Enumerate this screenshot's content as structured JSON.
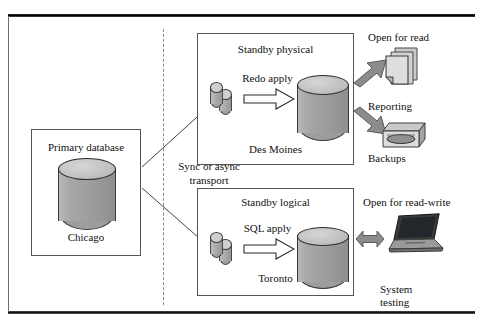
{
  "figure": {
    "divider": "dashed-vertical-separator"
  },
  "primary": {
    "title": "Primary database",
    "city": "Chicago",
    "icon": "database-cylinder-icon"
  },
  "transport": {
    "label": "Sync or async transport",
    "line1": "Sync or async",
    "line2": "transport"
  },
  "physical_standby": {
    "title": "Standby physical",
    "city": "Des Moines",
    "apply_label": "Redo apply",
    "logs_icon": "redo-log-cylinders-icon",
    "db_icon": "database-cylinder-icon"
  },
  "logical_standby": {
    "title": "Standby logical",
    "city": "Toronto",
    "apply_label": "SQL apply",
    "logs_icon": "redo-log-cylinders-icon",
    "db_icon": "database-cylinder-icon"
  },
  "consumers": {
    "read_label": "Open for read",
    "read_write_label": "Open for read-write",
    "reporting": {
      "label": "Reporting",
      "icon": "documents-stack-icon"
    },
    "backups": {
      "label": "Backups",
      "icon": "tape-drive-icon"
    },
    "system_testing": {
      "label": "System testing",
      "line1": "System",
      "line2": "testing",
      "icon": "laptop-icon"
    }
  },
  "colors": {
    "cylinder_fill": "#9d9d9d",
    "cylinder_top": "#c6c6c6",
    "arrow_gray": "#808080",
    "box_border": "#555555",
    "divider": "#8a8a8a",
    "text": "#111111"
  }
}
